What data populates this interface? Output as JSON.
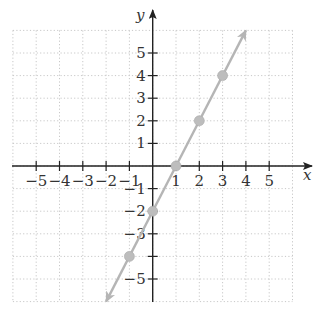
{
  "chart_data": {
    "type": "line",
    "title": "",
    "xlabel": "x",
    "ylabel": "y",
    "xlim": [
      -6,
      6
    ],
    "ylim": [
      -6,
      6
    ],
    "grid": true,
    "grid_style": "dotted",
    "x_ticks": [
      -5,
      -4,
      -3,
      -2,
      -1,
      1,
      2,
      3,
      4,
      5
    ],
    "x_tick_labels": [
      "−5",
      "−4",
      "−3",
      "−2",
      "−1",
      "1",
      "2",
      "3",
      "4",
      "5"
    ],
    "y_ticks": [
      -5,
      -4,
      -3,
      -2,
      -1,
      1,
      2,
      3,
      4,
      5
    ],
    "y_tick_labels": [
      "−5",
      "",
      "−3",
      "−2",
      "−1",
      "1",
      "2",
      "3",
      "4",
      "5"
    ],
    "series": [
      {
        "name": "line",
        "equation": "y = 2x - 2",
        "slope": 2,
        "intercept": -2,
        "x_range": [
          -2,
          4
        ],
        "arrows": "both",
        "color": "#b5b5b5"
      }
    ],
    "points": [
      {
        "x": -1,
        "y": -4
      },
      {
        "x": 0,
        "y": -2
      },
      {
        "x": 1,
        "y": 0
      },
      {
        "x": 2,
        "y": 2
      },
      {
        "x": 3,
        "y": 4
      }
    ],
    "point_color": "#bdbdbd"
  },
  "axes": {
    "x_label": "x",
    "y_label": "y"
  },
  "colors": {
    "axis": "#222222",
    "grid": "#c8c8c8",
    "line": "#b5b5b5",
    "point": "#bdbdbd"
  }
}
